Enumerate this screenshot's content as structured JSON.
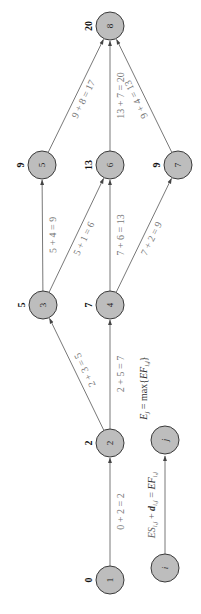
{
  "diagram": {
    "nodes": [
      {
        "id": "1",
        "label": "1",
        "es": "0"
      },
      {
        "id": "2",
        "label": "2",
        "es": "2"
      },
      {
        "id": "3",
        "label": "3",
        "es": "5"
      },
      {
        "id": "4",
        "label": "4",
        "es": "7"
      },
      {
        "id": "5",
        "label": "5",
        "es": "9"
      },
      {
        "id": "6",
        "label": "6",
        "es": "13"
      },
      {
        "id": "7",
        "label": "7",
        "es": "9"
      },
      {
        "id": "8",
        "label": "8",
        "es": "20"
      }
    ],
    "edges": [
      {
        "from": "1",
        "to": "2",
        "label": "0 + 2 = 2"
      },
      {
        "from": "2",
        "to": "3",
        "label": "2 + 3 = 5"
      },
      {
        "from": "2",
        "to": "4",
        "label": "2 + 5 = 7"
      },
      {
        "from": "3",
        "to": "5",
        "label": "5 + 4 = 9"
      },
      {
        "from": "3",
        "to": "6",
        "label": "5 + 1 = 6"
      },
      {
        "from": "4",
        "to": "6",
        "label": "7 + 6 = 13"
      },
      {
        "from": "4",
        "to": "7",
        "label": "7 + 2 = 9"
      },
      {
        "from": "5",
        "to": "8",
        "label": "9 + 8 = 17"
      },
      {
        "from": "6",
        "to": "8",
        "label": "13 + 7 = 20"
      },
      {
        "from": "7",
        "to": "8",
        "label": "9 + 4 = 13"
      }
    ],
    "legend": {
      "node_i": "i",
      "node_j": "j",
      "edge_formula": "ES_ij + d_ij = EF_ij",
      "edge_formula_parts": {
        "es": "ES",
        "es_sub": "i,j",
        "plus": " + ",
        "d": "d",
        "d_sub": "i,j",
        "eq": " = ",
        "ef": "EF",
        "ef_sub": "i,j"
      },
      "node_formula_parts": {
        "e": "E",
        "e_sub": "j",
        "eq": " = max{",
        "ef": "EF",
        "ef_sub": "i,j",
        "close": "}"
      }
    }
  }
}
